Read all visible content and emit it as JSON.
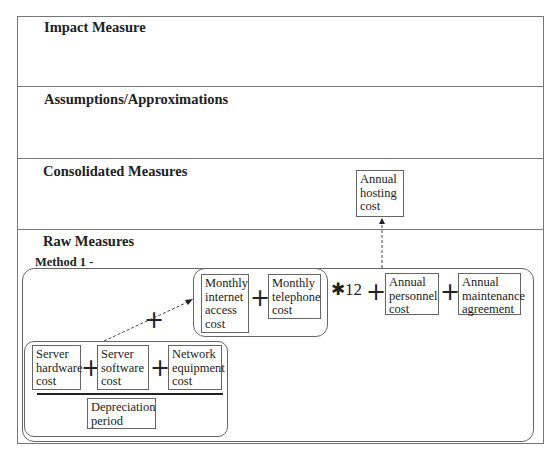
{
  "sections": {
    "impact": {
      "title": "Impact Measure"
    },
    "assumptions": {
      "title": "Assumptions/Approximations"
    },
    "consolidated": {
      "title": "Consolidated Measures"
    },
    "raw": {
      "title": "Raw Measures"
    }
  },
  "consolidated_nodes": {
    "annual_hosting_cost": [
      "Annual",
      "hosting",
      "cost"
    ]
  },
  "method": {
    "label": "Method 1 -",
    "monthly_group": {
      "internet": [
        "Monthly",
        "internet",
        "access",
        "cost"
      ],
      "telephone": [
        "Monthly",
        "telephone",
        "cost"
      ],
      "operator": "+"
    },
    "multiplier": "✱12",
    "annual_personnel": [
      "Annual",
      "personnel",
      "cost"
    ],
    "annual_maintenance": [
      "Annual",
      "maintenance",
      "agreement"
    ],
    "operators": [
      "+",
      "+",
      "+"
    ],
    "server_group": {
      "hardware": [
        "Server",
        "hardware",
        "cost"
      ],
      "software": [
        "Server",
        "software",
        "cost"
      ],
      "network": [
        "Network",
        "equipment",
        "cost"
      ],
      "operators": [
        "+",
        "+"
      ],
      "depreciation": [
        "Depreciation",
        "period"
      ]
    },
    "link_operator": "+"
  }
}
